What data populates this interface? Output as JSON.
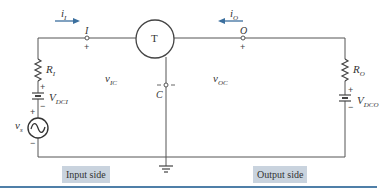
{
  "diagram": {
    "device_label": "T",
    "input_terminal": "I",
    "output_terminal": "O",
    "common_terminal": "C",
    "input_current": {
      "main": "i",
      "sub": "I"
    },
    "output_current": {
      "main": "i",
      "sub": "O"
    },
    "input_voltage": {
      "main": "v",
      "sub": "IC"
    },
    "output_voltage": {
      "main": "v",
      "sub": "OC"
    },
    "input_resistor": {
      "main": "R",
      "sub": "I"
    },
    "output_resistor": {
      "main": "R",
      "sub": "O"
    },
    "input_dc_source": {
      "main": "V",
      "sub": "DCI"
    },
    "output_dc_source": {
      "main": "V",
      "sub": "DCO"
    },
    "signal_source": {
      "main": "v",
      "sub": "s"
    },
    "plus": "+",
    "minus": "−",
    "input_side_label": "Input side",
    "output_side_label": "Output side"
  },
  "colors": {
    "wire": "#555555",
    "arrow": "#3b6f9e",
    "label_box": "#c9d3de",
    "rule": "#4f7fa8"
  }
}
